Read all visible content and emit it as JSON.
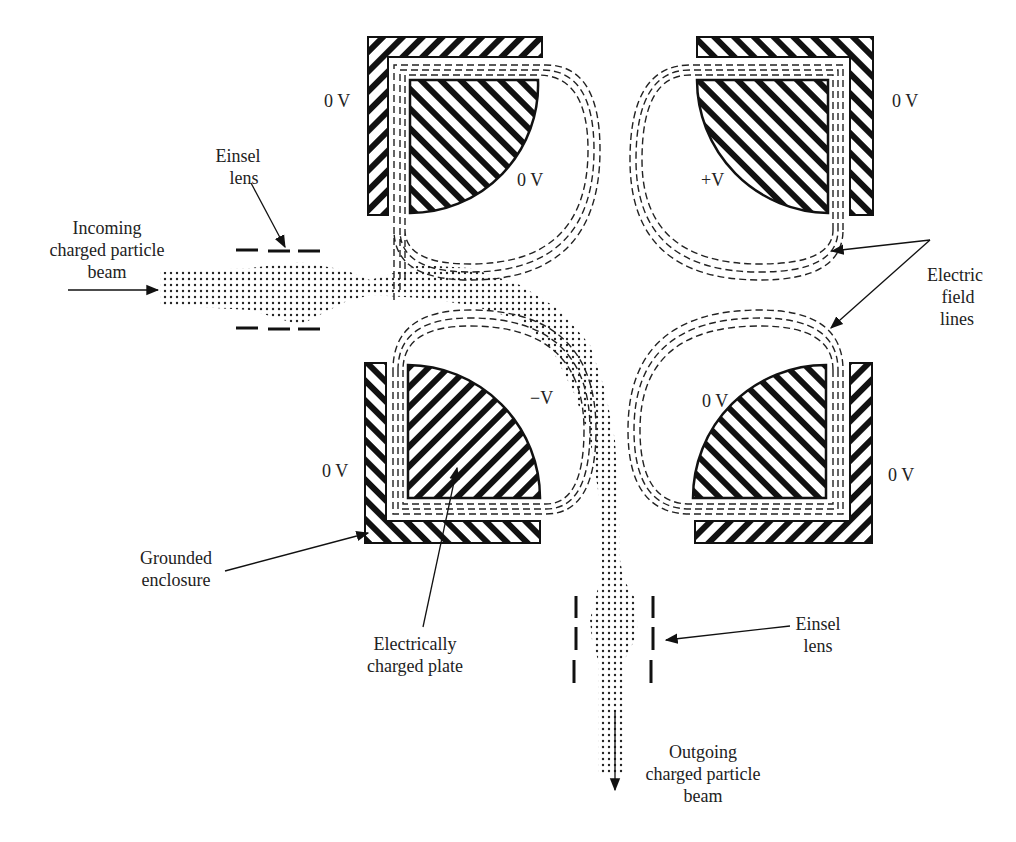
{
  "diagram": {
    "type": "electrostatic-quadrupole-deflector",
    "colors": {
      "ink": "#111111",
      "background": "#ffffff",
      "text": "#222222"
    },
    "plates": {
      "top_left": {
        "plate_voltage": "0 V",
        "enclosure_voltage": "0 V"
      },
      "top_right": {
        "plate_voltage": "+V",
        "enclosure_voltage": "0 V"
      },
      "bottom_left": {
        "plate_voltage": "−V",
        "enclosure_voltage": "0 V"
      },
      "bottom_right": {
        "plate_voltage": "0 V",
        "enclosure_voltage": "0 V"
      }
    },
    "labels": {
      "einsel_lens_top": [
        "Einsel",
        "lens"
      ],
      "incoming_beam": [
        "Incoming",
        "charged particle",
        "beam"
      ],
      "electric_field_lines": [
        "Electric",
        "field",
        "lines"
      ],
      "grounded_enclosure": [
        "Grounded",
        "enclosure"
      ],
      "charged_plate": [
        "Electrically",
        "charged plate"
      ],
      "einsel_lens_bottom": [
        "Einsel",
        "lens"
      ],
      "outgoing_beam": [
        "Outgoing",
        "charged particle",
        "beam"
      ]
    }
  }
}
